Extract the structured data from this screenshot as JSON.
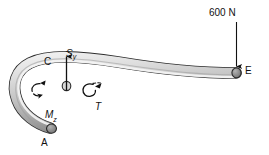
{
  "figure": {
    "type": "free-body-diagram",
    "background_color": "#ffffff",
    "pipe_color_light": "#e8e8e8",
    "pipe_color_mid": "#bdbdbd",
    "pipe_color_dark": "#8e8e8e",
    "endcap_color": "#7a7a7a",
    "outline_color": "#2b2b2b",
    "annotation_color": "#111111"
  },
  "load": {
    "value": "600",
    "unit": "N",
    "label": "600 N",
    "direction": "down",
    "applied_at": "E"
  },
  "points": {
    "a": "A",
    "c": "C",
    "e": "E"
  },
  "internal_forces": {
    "shear": {
      "symbol": "S",
      "subscript": "y",
      "label": "Sy",
      "direction": "up"
    },
    "moment": {
      "symbol": "M",
      "subscript": "z",
      "label": "Mz",
      "sense": "curved-arrow"
    },
    "torque": {
      "symbol": "T",
      "label": "T",
      "sense": "curved-arrow"
    }
  }
}
